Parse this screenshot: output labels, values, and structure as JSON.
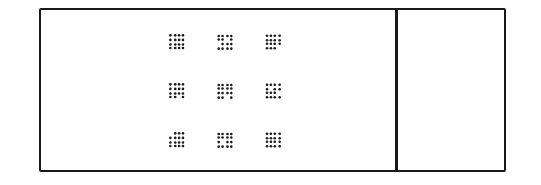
{
  "display": {
    "description": "3x3 array of dot-pattern stimuli in left panel; empty right panel",
    "colors": {
      "ink": "#1a1a1a",
      "background": "#ffffff"
    },
    "grid": {
      "rows": 3,
      "cols": 3
    },
    "patterns": [
      {
        "row": 0,
        "col": 0,
        "dots": [
          [
            1,
            1,
            1,
            1
          ],
          [
            1,
            1,
            1,
            1
          ],
          [
            1,
            1,
            1,
            1
          ],
          [
            1,
            1,
            1,
            1
          ]
        ]
      },
      {
        "row": 0,
        "col": 1,
        "dots": [
          [
            1,
            1,
            1,
            1
          ],
          [
            1,
            1,
            0,
            1
          ],
          [
            0,
            1,
            1,
            1
          ],
          [
            1,
            1,
            1,
            1
          ]
        ]
      },
      {
        "row": 0,
        "col": 2,
        "dots": [
          [
            1,
            1,
            1,
            1
          ],
          [
            1,
            1,
            1,
            1
          ],
          [
            1,
            1,
            1,
            1
          ],
          [
            1,
            1,
            1,
            0
          ]
        ]
      },
      {
        "row": 1,
        "col": 0,
        "dots": [
          [
            1,
            1,
            1,
            1
          ],
          [
            1,
            1,
            1,
            1
          ],
          [
            1,
            1,
            1,
            1
          ],
          [
            1,
            1,
            0,
            1
          ]
        ]
      },
      {
        "row": 1,
        "col": 1,
        "dots": [
          [
            1,
            1,
            1,
            1
          ],
          [
            1,
            1,
            1,
            1
          ],
          [
            1,
            1,
            1,
            1
          ],
          [
            1,
            1,
            0,
            1
          ]
        ]
      },
      {
        "row": 1,
        "col": 2,
        "dots": [
          [
            1,
            1,
            1,
            1
          ],
          [
            1,
            0,
            1,
            1
          ],
          [
            1,
            1,
            1,
            0
          ],
          [
            1,
            1,
            1,
            1
          ]
        ]
      },
      {
        "row": 2,
        "col": 0,
        "dots": [
          [
            0,
            1,
            1,
            1
          ],
          [
            1,
            1,
            1,
            1
          ],
          [
            1,
            1,
            1,
            1
          ],
          [
            1,
            1,
            1,
            1
          ]
        ]
      },
      {
        "row": 2,
        "col": 1,
        "dots": [
          [
            1,
            1,
            1,
            1
          ],
          [
            1,
            1,
            1,
            1
          ],
          [
            1,
            0,
            1,
            1
          ],
          [
            1,
            1,
            1,
            1
          ]
        ]
      },
      {
        "row": 2,
        "col": 2,
        "dots": [
          [
            1,
            1,
            1,
            1
          ],
          [
            1,
            1,
            1,
            1
          ],
          [
            1,
            1,
            1,
            1
          ],
          [
            1,
            1,
            1,
            1
          ]
        ]
      }
    ]
  }
}
